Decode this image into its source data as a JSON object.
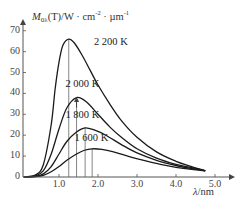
{
  "chart_data": {
    "type": "line",
    "title": "",
    "ylabel": "M0λ(T)/W · cm⁻² · µm⁻¹",
    "ylabel_parts": {
      "symbol": "M",
      "subscript": "0λ",
      "rest": "(T)/W · cm",
      "exp1": "-2",
      "mid": " · µm",
      "exp2": "-1"
    },
    "xlabel": "λ/nm",
    "xlabel_parts": {
      "symbol": "λ",
      "unit": "/nm"
    },
    "xlim": [
      0,
      5.3
    ],
    "ylim": [
      0,
      72
    ],
    "x_ticks": [
      "1.0",
      "2.0",
      "3.0",
      "4.0",
      "5.0"
    ],
    "x_tick_values": [
      1.0,
      2.0,
      3.0,
      4.0,
      5.0
    ],
    "y_ticks": [
      "0",
      "10",
      "20",
      "30",
      "40",
      "50",
      "60",
      "70"
    ],
    "y_tick_values": [
      0,
      10,
      20,
      30,
      40,
      50,
      60,
      70
    ],
    "grid": false,
    "legend": "inline labels",
    "series": [
      {
        "name": "2 200 K",
        "peak": {
          "x": 1.25,
          "y": 66
        },
        "label_pos": {
          "x": 2.05,
          "y": 64
        },
        "x": [
          0.1,
          0.4,
          0.6,
          0.8,
          0.9,
          1.0,
          1.1,
          1.25,
          1.4,
          1.6,
          1.8,
          2.0,
          2.3,
          2.6,
          3.0,
          3.5,
          4.0,
          4.4,
          4.75
        ],
        "values": [
          0,
          1,
          6,
          25,
          42,
          55,
          63,
          66,
          64,
          58,
          51,
          44,
          35,
          27,
          19,
          12,
          7.5,
          5,
          3
        ]
      },
      {
        "name": "2 000 K",
        "peak": {
          "x": 1.45,
          "y": 38
        },
        "label_pos": {
          "x": 1.32,
          "y": 44
        },
        "x": [
          0.1,
          0.4,
          0.6,
          0.8,
          1.0,
          1.2,
          1.45,
          1.7,
          2.0,
          2.3,
          2.6,
          3.0,
          3.5,
          4.0,
          4.4,
          4.75
        ],
        "values": [
          0,
          0.5,
          3,
          11,
          23,
          33,
          38,
          36,
          30,
          24,
          19,
          13.5,
          9,
          6,
          4.5,
          3
        ]
      },
      {
        "name": "1 800 K",
        "peak": {
          "x": 1.67,
          "y": 23.5
        },
        "label_pos": {
          "x": 1.32,
          "y": 29
        },
        "x": [
          0.1,
          0.4,
          0.6,
          0.8,
          1.0,
          1.2,
          1.45,
          1.67,
          1.9,
          2.2,
          2.6,
          3.0,
          3.5,
          4.0,
          4.4,
          4.75
        ],
        "values": [
          0,
          0.3,
          1.5,
          5,
          11,
          17,
          21.5,
          23.5,
          22.5,
          20,
          15.5,
          11.5,
          8,
          5.5,
          4,
          3
        ]
      },
      {
        "name": "1 600 K",
        "peak": {
          "x": 1.85,
          "y": 13.5
        },
        "label_pos": {
          "x": 1.55,
          "y": 18
        },
        "x": [
          0.1,
          0.4,
          0.6,
          0.8,
          1.0,
          1.2,
          1.45,
          1.65,
          1.85,
          2.1,
          2.4,
          2.8,
          3.2,
          3.6,
          4.0,
          4.4,
          4.75
        ],
        "values": [
          0,
          0.2,
          0.8,
          2.5,
          5,
          8,
          11,
          12.8,
          13.5,
          13.2,
          12,
          9.8,
          7.8,
          6,
          4.6,
          3.6,
          3
        ]
      }
    ],
    "peak_markers": [
      1.25,
      1.45,
      1.67,
      1.85
    ],
    "annotations": [
      "arrow pointing up to 2 000 K peak"
    ]
  },
  "colors": {
    "curve": "#1a1a1a",
    "axis": "#555555",
    "peak_line": "#666666",
    "text": "#333333"
  }
}
